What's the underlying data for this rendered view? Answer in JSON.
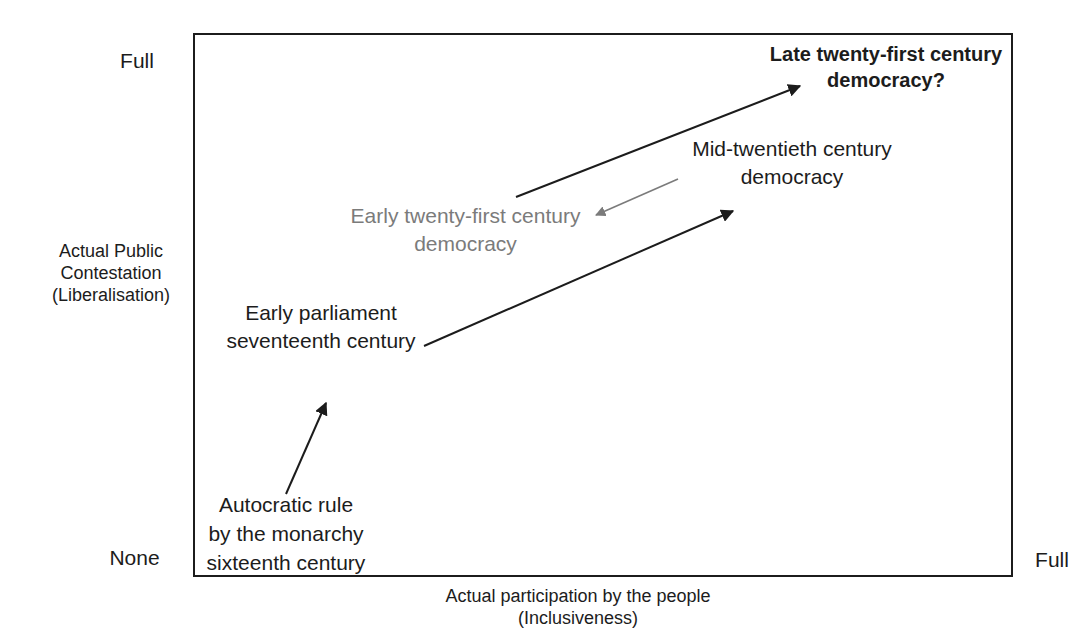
{
  "figure": {
    "background": "#ffffff",
    "box_border_color": "#1c1c1c",
    "text_color": "#1c1c1c",
    "muted_color": "#7b7b7b"
  },
  "axes": {
    "y": {
      "label_lines": [
        "Actual Public",
        "Contestation",
        "(Liberalisation)"
      ],
      "top_label": "Full",
      "bottom_label": "None"
    },
    "x": {
      "label_lines": [
        "Actual participation by the people",
        "(Inclusiveness)"
      ],
      "right_label": "Full"
    }
  },
  "stages": [
    {
      "id": "autocratic-rule",
      "lines": [
        "Autocratic rule",
        "by the monarchy",
        "sixteenth century"
      ],
      "emphasis": "normal",
      "color": "#1c1c1c"
    },
    {
      "id": "early-parliament",
      "lines": [
        "Early parliament",
        "seventeenth century"
      ],
      "emphasis": "normal",
      "color": "#1c1c1c"
    },
    {
      "id": "early-21st-century",
      "lines": [
        "Early twenty-first century",
        "democracy"
      ],
      "emphasis": "muted",
      "color": "#7b7b7b"
    },
    {
      "id": "mid-20th-century",
      "lines": [
        "Mid-twentieth century",
        "democracy"
      ],
      "emphasis": "normal",
      "color": "#1c1c1c"
    },
    {
      "id": "late-21st-century",
      "lines": [
        "Late twenty-first century",
        "democracy?"
      ],
      "emphasis": "bold",
      "color": "#1c1c1c"
    }
  ],
  "arrows": [
    {
      "from": "autocratic-rule",
      "to": "early-parliament",
      "color": "#1c1c1c",
      "x1": 286,
      "y1": 494,
      "x2": 326,
      "y2": 403,
      "width": 2
    },
    {
      "from": "early-parliament",
      "to": "mid-20th-century",
      "color": "#1c1c1c",
      "x1": 424,
      "y1": 346,
      "x2": 733,
      "y2": 211,
      "width": 2
    },
    {
      "from": "early-21st-century",
      "to": "late-21st-century",
      "color": "#1c1c1c",
      "x1": 516,
      "y1": 197,
      "x2": 800,
      "y2": 86,
      "width": 2
    },
    {
      "from": "mid-20th-century",
      "to": "early-21st-century",
      "color": "#7b7b7b",
      "x1": 678,
      "y1": 179,
      "x2": 596,
      "y2": 215,
      "width": 1.6
    }
  ]
}
